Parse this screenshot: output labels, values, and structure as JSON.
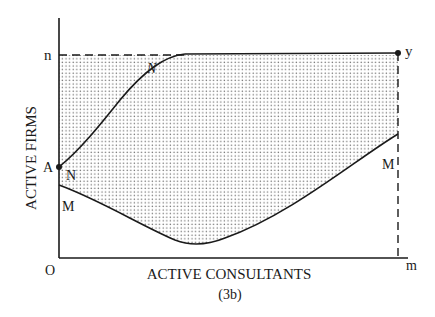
{
  "figure": {
    "caption": "(3b)",
    "x_axis_label": "ACTIVE CONSULTANTS",
    "y_axis_label": "ACTIVE FIRMS",
    "origin_label": "O",
    "x_max_label": "m",
    "y_max_label": "n",
    "corner_point_label": "y",
    "point_a_label": "A",
    "upper_curve_labels": [
      "N",
      "N"
    ],
    "lower_curve_labels": [
      "M",
      "M"
    ],
    "colors": {
      "line": "#1a1a1a",
      "dot_fill": "#6e6e6e",
      "background": "#ffffff"
    }
  }
}
